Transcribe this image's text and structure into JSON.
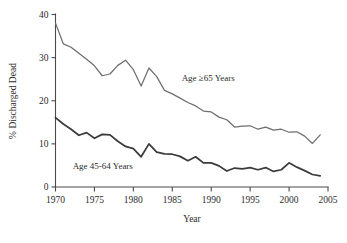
{
  "chart_data": {
    "type": "line",
    "title": "",
    "xlabel": "Year",
    "ylabel": "% Discharged Dead",
    "xlim": [
      1970,
      2005
    ],
    "ylim": [
      0,
      40
    ],
    "xticks": [
      1970,
      1975,
      1980,
      1985,
      1990,
      1995,
      2000,
      2005
    ],
    "yticks": [
      0,
      10,
      20,
      30,
      40
    ],
    "xtick_labels": [
      "1970",
      "1975",
      "1980",
      "1985",
      "1990",
      "1995",
      "2000",
      "2005"
    ],
    "ytick_labels": [
      "0",
      "10",
      "20",
      "30",
      "40"
    ],
    "grid": false,
    "legend": "inline-annotations",
    "x": [
      1970,
      1971,
      1972,
      1973,
      1974,
      1975,
      1976,
      1977,
      1978,
      1979,
      1980,
      1981,
      1982,
      1983,
      1984,
      1985,
      1986,
      1987,
      1988,
      1989,
      1990,
      1991,
      1992,
      1993,
      1994,
      1995,
      1996,
      1997,
      1998,
      1999,
      2000,
      2001,
      2002,
      2003,
      2004
    ],
    "series": [
      {
        "name": "Age ≥65 Years",
        "color": "#6e6e6e",
        "label_x": 1986.2,
        "label_y": 24.6,
        "values": [
          38.0,
          33.2,
          32.4,
          31.0,
          29.6,
          28.1,
          25.8,
          26.2,
          28.2,
          29.4,
          27.2,
          23.4,
          27.6,
          25.6,
          22.4,
          21.6,
          20.6,
          19.6,
          18.8,
          17.6,
          17.4,
          16.2,
          15.6,
          13.9,
          14.1,
          14.2,
          13.4,
          13.9,
          13.2,
          13.4,
          12.7,
          12.8,
          11.8,
          10.1,
          12.1
        ]
      },
      {
        "name": "Age 45-64 Years",
        "color": "#3c3c3c",
        "label_x": 1972.2,
        "label_y": 4.2,
        "values": [
          16.1,
          14.6,
          13.4,
          12.0,
          12.6,
          11.3,
          12.2,
          12.1,
          10.6,
          9.4,
          8.9,
          7.0,
          10.0,
          8.1,
          7.7,
          7.6,
          7.1,
          6.1,
          7.0,
          5.6,
          5.6,
          4.9,
          3.7,
          4.4,
          4.2,
          4.5,
          4.0,
          4.5,
          3.6,
          4.0,
          5.6,
          4.6,
          3.8,
          2.9,
          2.6
        ]
      }
    ]
  },
  "axes": {
    "y_axis_title": "% Discharged Dead",
    "x_axis_title": "Year"
  }
}
